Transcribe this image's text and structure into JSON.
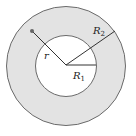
{
  "diagram": {
    "type": "annulus",
    "labels": {
      "r": "r",
      "R1": "R",
      "R1_sub": "1",
      "R2": "R",
      "R2_sub": "2"
    },
    "colors": {
      "ring_fill": "#e3e3e3",
      "inner_fill": "#ffffff",
      "stroke": "#555555"
    }
  }
}
